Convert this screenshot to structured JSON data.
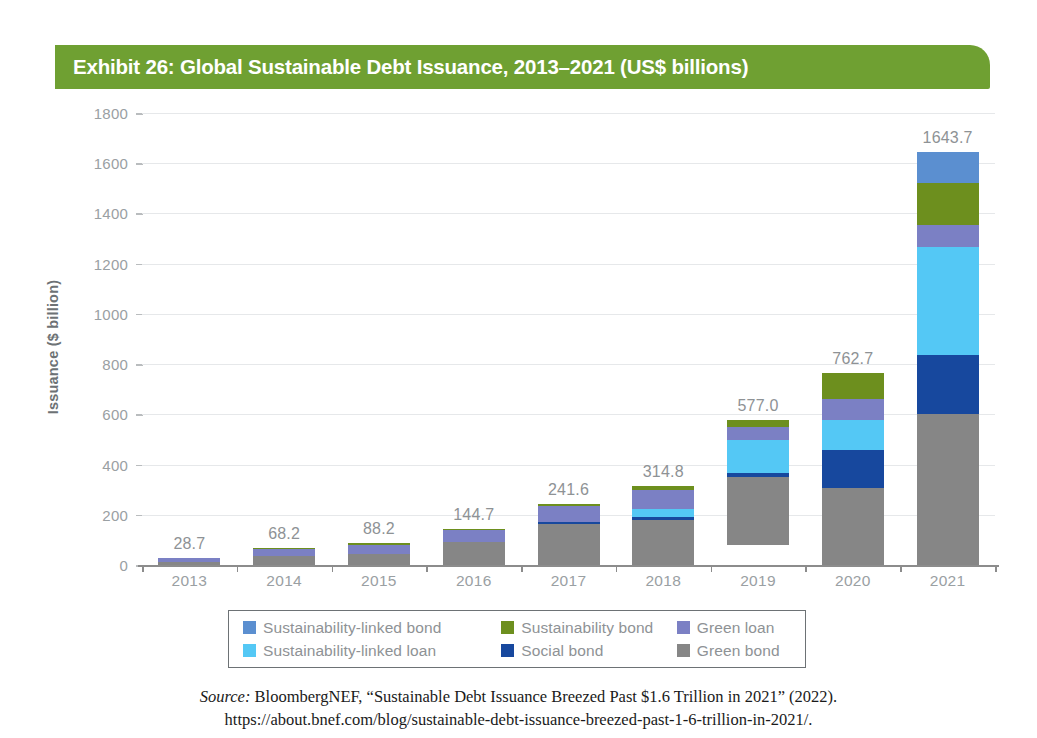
{
  "title": {
    "text": "Exhibit 26: Global Sustainable Debt Issuance, 2013–2021 (US$ billions)",
    "banner_color": "#6fa032",
    "text_color": "#ffffff"
  },
  "axes": {
    "y_title": "Issuance ($ billion)",
    "y_ticks": [
      "1800",
      "1600",
      "1400",
      "1200",
      "1000",
      "800",
      "600",
      "400",
      "200",
      "0"
    ],
    "x_ticks": [
      "2013",
      "2014",
      "2015",
      "2016",
      "2017",
      "2018",
      "2019",
      "2020",
      "2021"
    ]
  },
  "legend": {
    "row1": [
      {
        "label": "Sustainability-linked bond",
        "color": "#5b8fd0"
      },
      {
        "label": "Sustainability bond",
        "color": "#6d8f1e"
      },
      {
        "label": "Green loan",
        "color": "#7b80c4"
      }
    ],
    "row2": [
      {
        "label": "Sustainability-linked loan",
        "color": "#54c8f5"
      },
      {
        "label": "Social bond",
        "color": "#17489e"
      },
      {
        "label": "Green bond",
        "color": "#868686"
      }
    ]
  },
  "source": {
    "label": "Source:",
    "line1": " BloombergNEF, “Sustainable Debt Issuance Breezed Past $1.6 Trillion in 2021” (2022).",
    "line2": "https://about.bnef.com/blog/sustainable-debt-issuance-breezed-past-1-6-trillion-in-2021/."
  },
  "chart_data": {
    "type": "bar",
    "subtype": "stacked",
    "title": "Exhibit 26: Global Sustainable Debt Issuance, 2013–2021 (US$ billions)",
    "xlabel": "",
    "ylabel": "Issuance ($ billion)",
    "ylim": [
      0,
      1800
    ],
    "ytick_step": 200,
    "grid": true,
    "legend_position": "bottom",
    "categories": [
      "2013",
      "2014",
      "2015",
      "2016",
      "2017",
      "2018",
      "2019",
      "2020",
      "2021"
    ],
    "totals": [
      28.7,
      68.2,
      88.2,
      144.7,
      241.6,
      314.8,
      577.0,
      762.7,
      1643.7
    ],
    "total_labels": [
      "28.7",
      "68.2",
      "88.2",
      "144.7",
      "241.6",
      "314.8",
      "577.0",
      "762.7",
      "1643.7"
    ],
    "series": [
      {
        "name": "Green bond",
        "color": "#868686",
        "values": [
          11.0,
          36.6,
          45.5,
          93.4,
          162.1,
          178.4,
          271.0,
          305.0,
          603.0
        ]
      },
      {
        "name": "Social bond",
        "color": "#17489e",
        "values": [
          0.0,
          0.0,
          0.0,
          0.0,
          10.3,
          14.2,
          17.0,
          152.0,
          232.0
        ]
      },
      {
        "name": "Sustainability-linked loan",
        "color": "#54c8f5",
        "values": [
          0.0,
          0.0,
          0.0,
          0.0,
          0.0,
          30.0,
          130.0,
          120.0,
          430.0
        ]
      },
      {
        "name": "Green loan",
        "color": "#7b80c4",
        "values": [
          17.7,
          25.6,
          36.0,
          44.3,
          63.2,
          78.0,
          50.0,
          85.0,
          90.0
        ]
      },
      {
        "name": "Sustainability bond",
        "color": "#6d8f1e",
        "values": [
          0.0,
          6.0,
          6.7,
          7.0,
          6.0,
          14.2,
          29.0,
          100.7,
          168.0
        ]
      },
      {
        "name": "Sustainability-linked bond",
        "color": "#5b8fd0",
        "values": [
          0.0,
          0.0,
          0.0,
          0.0,
          0.0,
          0.0,
          0.0,
          0.0,
          120.7
        ]
      }
    ]
  }
}
